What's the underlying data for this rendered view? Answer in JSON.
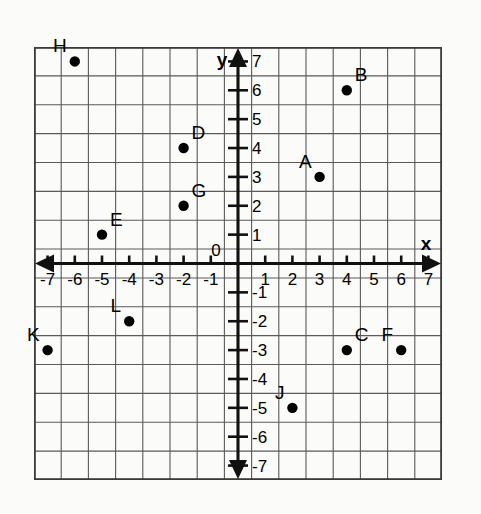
{
  "figure": {
    "type": "coordinate-plane",
    "axis_labels": {
      "x": "x",
      "y": "y"
    },
    "origin_label": "0"
  },
  "chart_data": {
    "type": "scatter",
    "title": "",
    "xlabel": "x",
    "ylabel": "y",
    "xlim": [
      -7.5,
      7.5
    ],
    "ylim": [
      -7.5,
      7.5
    ],
    "grid": true,
    "legend": "none",
    "x_ticks": [
      -7,
      -6,
      -5,
      -4,
      -3,
      -2,
      -1,
      1,
      2,
      3,
      4,
      5,
      6,
      7
    ],
    "y_ticks": [
      -7,
      -6,
      -5,
      -4,
      -3,
      -2,
      -1,
      1,
      2,
      3,
      4,
      5,
      6,
      7
    ],
    "x_tick_labels": [
      "-7",
      "-6",
      "-5",
      "-4",
      "-3",
      "-2",
      "-1",
      "1",
      "2",
      "3",
      "4",
      "5",
      "6",
      "7"
    ],
    "y_tick_labels": [
      "-7",
      "-6",
      "-5",
      "-4",
      "-3",
      "-2",
      "-1",
      "1",
      "2",
      "3",
      "4",
      "5",
      "6",
      "7"
    ],
    "points": [
      {
        "label": "A",
        "x": 3,
        "y": 3,
        "label_pos": "upper-left"
      },
      {
        "label": "B",
        "x": 4,
        "y": 6,
        "label_pos": "upper-right"
      },
      {
        "label": "C",
        "x": 4,
        "y": -3,
        "label_pos": "upper-right"
      },
      {
        "label": "D",
        "x": -2,
        "y": 4,
        "label_pos": "upper-right"
      },
      {
        "label": "E",
        "x": -5,
        "y": 1,
        "label_pos": "upper-right"
      },
      {
        "label": "F",
        "x": 6,
        "y": -3,
        "label_pos": "upper-left"
      },
      {
        "label": "G",
        "x": -2,
        "y": 2,
        "label_pos": "upper-right"
      },
      {
        "label": "H",
        "x": -6,
        "y": 7,
        "label_pos": "upper-left"
      },
      {
        "label": "J",
        "x": 2,
        "y": -5,
        "label_pos": "upper-left"
      },
      {
        "label": "K",
        "x": -7,
        "y": -3,
        "label_pos": "upper-left"
      },
      {
        "label": "L",
        "x": -4,
        "y": -2,
        "label_pos": "upper-left"
      }
    ]
  },
  "colors": {
    "point": "#000000",
    "axis": "#111111",
    "grid": "#5a5a5a",
    "frame": "#3a3a3a",
    "background": "#fbfbfa"
  }
}
